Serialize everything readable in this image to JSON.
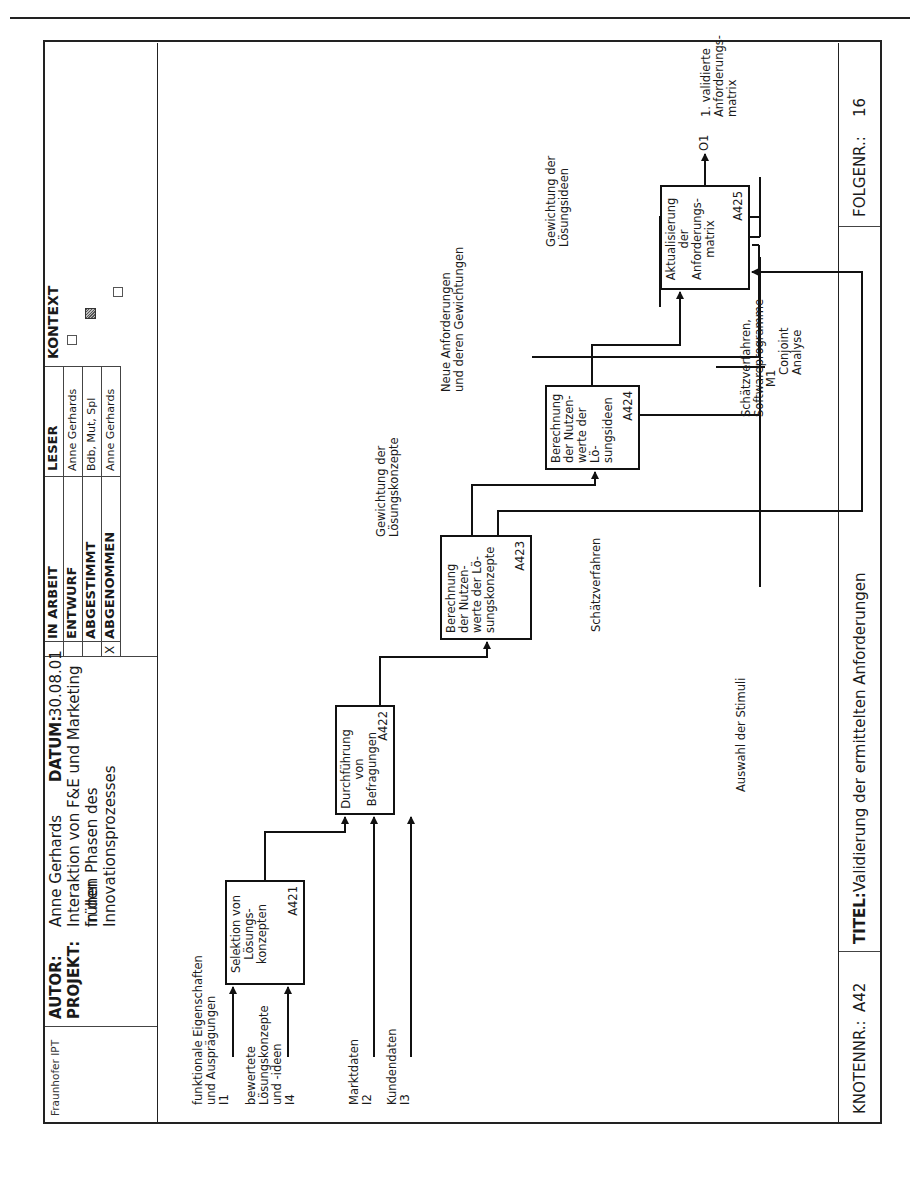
{
  "header": {
    "org": "Fraunhofer IPT",
    "author_label": "AUTOR:",
    "author": "Anne Gerhards",
    "project_label": "PROJEKT:",
    "project_line1": "Interaktion von F&E und Marketing in den",
    "project_line2": "frühen Phasen des Innovationsprozesses",
    "date_label": "DATUM:",
    "date": "30.08.01",
    "status": [
      {
        "mark": "",
        "label": "IN ARBEIT"
      },
      {
        "mark": "",
        "label": "ENTWURF"
      },
      {
        "mark": "",
        "label": "ABGESTIMMT"
      },
      {
        "mark": "X",
        "label": "ABGENOMMEN"
      }
    ],
    "reader_label": "LESER",
    "readers": [
      "Anne Gerhards",
      "Bdb, Mut, Spl",
      "Anne Gerhards"
    ],
    "context_label": "KONTEXT"
  },
  "footer": {
    "node_label": "KNOTENNR.:",
    "node": "A42",
    "title_label": "TITEL:",
    "title": "Validierung der ermittelten Anforderungen",
    "seq_label": "FOLGENR.:",
    "seq": "16"
  },
  "activities": [
    {
      "id": "A421",
      "lines": [
        "Selektion von",
        "Lösungs-",
        "konzepten"
      ]
    },
    {
      "id": "A422",
      "lines": [
        "Durchführung",
        "von",
        "Befragungen"
      ]
    },
    {
      "id": "A423",
      "lines": [
        "Berechnung",
        "der Nutzen-",
        "werte der Lö-",
        "sungskonzepte"
      ]
    },
    {
      "id": "A424",
      "lines": [
        "Berechnung",
        "der Nutzen-",
        "werte der Lö-",
        "sungsideen"
      ]
    },
    {
      "id": "A425",
      "lines": [
        "Aktualisierung",
        "der",
        "Anforderungs-",
        "matrix"
      ]
    }
  ],
  "inputs": [
    {
      "code": "I1",
      "label": [
        "funktionale Eigenschaften",
        "und Ausprägungen"
      ]
    },
    {
      "code": "I4",
      "label": [
        "bewertete",
        "Lösungskonzepte",
        "und -ideen"
      ]
    },
    {
      "code": "I2",
      "label": [
        "Marktdaten"
      ]
    },
    {
      "code": "I3",
      "label": [
        "Kundendaten"
      ]
    }
  ],
  "mechanism": {
    "code": "M1",
    "label": [
      "Conjoint",
      "Analyse"
    ]
  },
  "output": {
    "code": "O1",
    "label": [
      "1. validierte",
      "Anforderungs-",
      "matrix"
    ]
  },
  "annotations": {
    "gew_konzepte": [
      "Gewichtung der",
      "Lösungskonzepte"
    ],
    "neue_anf": [
      "Neue Anforderungen",
      "und deren Gewichtungen"
    ],
    "gew_ideen": [
      "Gewichtung der",
      "Lösungsideen"
    ],
    "schaetz": [
      "Schätzverfahren"
    ],
    "schaetz_sw": [
      "Schätzverfahren,",
      "Softwareprogramme"
    ],
    "stimuli": [
      "Auswahl der Stimuli"
    ]
  }
}
